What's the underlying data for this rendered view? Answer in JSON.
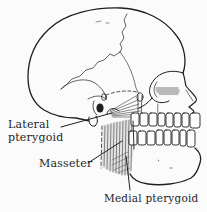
{
  "figure": {
    "labels": {
      "lateral_pterygoid": "Lateral\npterygoid",
      "masseter": "Masseter",
      "medial_pterygoid": "Medial pterygoid"
    },
    "colors": {
      "ink": "#1f1f1f",
      "paper": "#fbfbfb",
      "muscle": "#e0e0e0"
    }
  }
}
